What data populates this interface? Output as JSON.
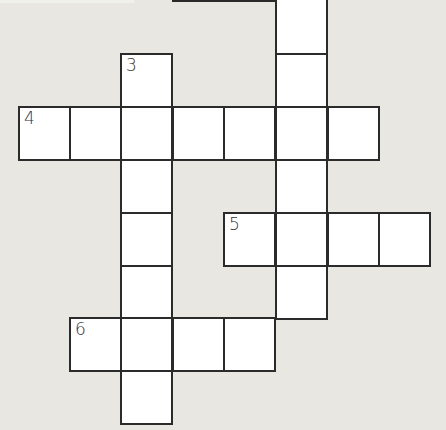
{
  "puzzle": {
    "type": "crossword",
    "cell_size_px": 51.5,
    "col_origins_px": [
      18,
      69,
      120,
      172,
      223,
      275,
      327,
      378
    ],
    "row_origins_px": [
      0,
      53,
      106,
      159,
      212,
      265,
      317,
      370
    ],
    "clue_numbers": [
      "3",
      "4",
      "5",
      "6"
    ],
    "entries": [
      {
        "number": "",
        "direction": "down",
        "row": 0,
        "col": 5,
        "length": 6,
        "note": "continues above visible area"
      },
      {
        "number": "3",
        "direction": "down",
        "row": 1,
        "col": 2,
        "length": 7
      },
      {
        "number": "4",
        "direction": "across",
        "row": 2,
        "col": 0,
        "length": 7
      },
      {
        "number": "5",
        "direction": "across",
        "row": 4,
        "col": 4,
        "length": 4
      },
      {
        "number": "6",
        "direction": "across",
        "row": 6,
        "col": 1,
        "length": 4
      }
    ],
    "cells": [
      {
        "r": 0,
        "c": 5,
        "num": ""
      },
      {
        "r": 1,
        "c": 2,
        "num": "3"
      },
      {
        "r": 1,
        "c": 5,
        "num": ""
      },
      {
        "r": 2,
        "c": 0,
        "num": "4"
      },
      {
        "r": 2,
        "c": 1,
        "num": ""
      },
      {
        "r": 2,
        "c": 2,
        "num": ""
      },
      {
        "r": 2,
        "c": 3,
        "num": ""
      },
      {
        "r": 2,
        "c": 4,
        "num": ""
      },
      {
        "r": 2,
        "c": 5,
        "num": ""
      },
      {
        "r": 2,
        "c": 6,
        "num": ""
      },
      {
        "r": 3,
        "c": 2,
        "num": ""
      },
      {
        "r": 3,
        "c": 5,
        "num": ""
      },
      {
        "r": 4,
        "c": 2,
        "num": ""
      },
      {
        "r": 4,
        "c": 4,
        "num": "5"
      },
      {
        "r": 4,
        "c": 5,
        "num": ""
      },
      {
        "r": 4,
        "c": 6,
        "num": ""
      },
      {
        "r": 4,
        "c": 7,
        "num": ""
      },
      {
        "r": 5,
        "c": 2,
        "num": ""
      },
      {
        "r": 5,
        "c": 5,
        "num": ""
      },
      {
        "r": 6,
        "c": 1,
        "num": "6"
      },
      {
        "r": 6,
        "c": 2,
        "num": ""
      },
      {
        "r": 6,
        "c": 3,
        "num": ""
      },
      {
        "r": 6,
        "c": 4,
        "num": ""
      },
      {
        "r": 7,
        "c": 2,
        "num": ""
      }
    ]
  },
  "colors": {
    "background": "#e8e7e1",
    "cell": "#ffffff",
    "border": "#2b2b2b"
  }
}
